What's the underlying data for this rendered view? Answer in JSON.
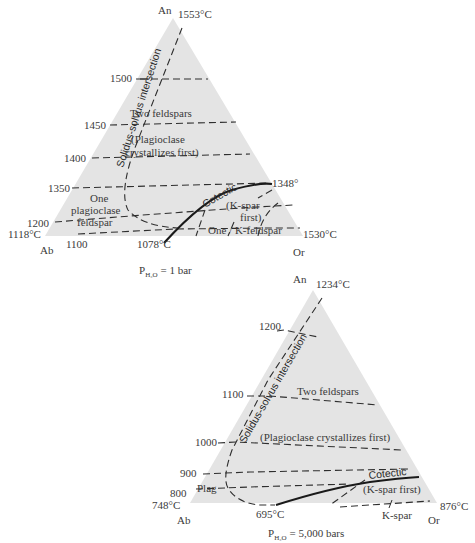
{
  "diagrams": [
    {
      "id": "top",
      "caption_main": "P",
      "caption_sub": "H₂O",
      "caption_rest": " = 1 bar",
      "vertices": {
        "apex": {
          "label": "An",
          "temp": "1553°C"
        },
        "left": {
          "label": "Ab",
          "temp": "1118°C"
        },
        "right": {
          "label": "Or",
          "temp": "1530°C"
        }
      },
      "isotherms": [
        "1500",
        "1450",
        "1400",
        "1350",
        "1200",
        "1100"
      ],
      "bottom_temp": "1078°C",
      "cotectic_end_temp": "1348°",
      "curve_label": "Solidus-solvus intersection",
      "cotectic_label": "Cotectic",
      "fields": {
        "two_feldspars": "Two feldspars",
        "plag_first_1": "(Plagioclase",
        "plag_first_2": "crystallizes first)",
        "one_plag_1": "One",
        "one_plag_2": "plagioclase",
        "one_plag_3": "feldspar",
        "kspar_first_1": "(K-spar",
        "kspar_first_2": "first)",
        "one_kfeld": "One / K-feldspar"
      }
    },
    {
      "id": "bottom",
      "caption_main": "P",
      "caption_sub": "H₂O",
      "caption_rest": " = 5,000 bars",
      "vertices": {
        "apex": {
          "label": "An",
          "temp": "1234°C"
        },
        "left": {
          "label": "Ab",
          "temp": "748°C"
        },
        "right": {
          "label": "Or",
          "temp": "876°C"
        }
      },
      "isotherms": [
        "1200",
        "1100",
        "1000",
        "900",
        "800"
      ],
      "bottom_temp": "695°C",
      "curve_label": "Solidus-solvus intersection",
      "cotectic_label": "Cotectic",
      "fields": {
        "two_feldspars": "Two feldspars",
        "plag_first": "(Plagioclase crystallizes first)",
        "plag": "Plag",
        "kspar_first": "(K-spar first)",
        "kspar": "K-spar"
      }
    }
  ],
  "colors": {
    "field_fill": "#e4e4e4",
    "line": "#2e2e2e",
    "background": "#ffffff"
  }
}
